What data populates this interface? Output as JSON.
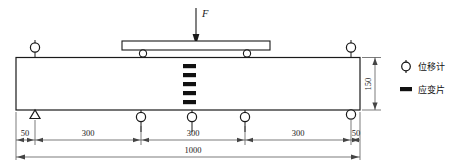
{
  "figure": {
    "type": "beam-test-setup-diagram",
    "load_label": "F",
    "beam_depth_label": "150",
    "total_span_label": "1000",
    "segments": [
      {
        "label": "50"
      },
      {
        "label": "300"
      },
      {
        "label": "300"
      },
      {
        "label": "300"
      },
      {
        "label": "50"
      }
    ]
  },
  "legend": {
    "items": [
      {
        "symbol": "displacement-gauge-symbol",
        "label": "位移计"
      },
      {
        "symbol": "strain-gauge-symbol",
        "label": "应变片"
      }
    ]
  },
  "instruments": {
    "displacement_gauges_top": 2,
    "displacement_gauges_bottom": 3,
    "strain_gauges": 5
  },
  "supports": {
    "left": "pin-support-triangle",
    "right": "roller-support-circle"
  },
  "spreader": {
    "rollers": 2
  },
  "colors": {
    "line": "#1a1a1a",
    "fill": "#ffffff",
    "strain_gauge": "#111111",
    "dimension_line": "#444444"
  }
}
